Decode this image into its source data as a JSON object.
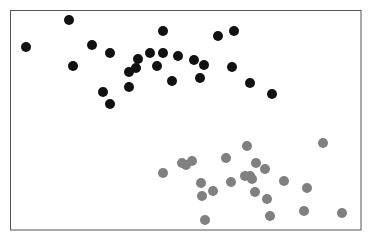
{
  "chart_data": {
    "type": "scatter",
    "title": "",
    "xlabel": "",
    "ylabel": "",
    "grid": false,
    "legend": null,
    "axes_ticks": false,
    "frame": {
      "left": 10,
      "top": 10,
      "right": 361,
      "bottom": 230
    },
    "series": [
      {
        "name": "cluster-black",
        "color": "#111111",
        "points": [
          [
            26,
            47
          ],
          [
            69,
            20
          ],
          [
            73,
            66
          ],
          [
            92,
            45
          ],
          [
            110,
            53
          ],
          [
            103,
            92
          ],
          [
            110,
            104
          ],
          [
            129,
            72
          ],
          [
            129,
            87
          ],
          [
            136,
            68
          ],
          [
            138,
            59
          ],
          [
            150,
            53
          ],
          [
            157,
            66
          ],
          [
            163,
            31
          ],
          [
            163,
            53
          ],
          [
            172,
            81
          ],
          [
            178,
            56
          ],
          [
            194,
            60
          ],
          [
            200,
            78
          ],
          [
            204,
            65
          ],
          [
            218,
            36
          ],
          [
            234,
            31
          ],
          [
            232,
            67
          ],
          [
            250,
            83
          ],
          [
            272,
            94
          ]
        ]
      },
      {
        "name": "cluster-gray",
        "color": "#808080",
        "points": [
          [
            163,
            173
          ],
          [
            182,
            163
          ],
          [
            186,
            165
          ],
          [
            192,
            161
          ],
          [
            201,
            183
          ],
          [
            202,
            196
          ],
          [
            213,
            191
          ],
          [
            226,
            158
          ],
          [
            231,
            182
          ],
          [
            247,
            146
          ],
          [
            245,
            176
          ],
          [
            250,
            176
          ],
          [
            252,
            179
          ],
          [
            256,
            163
          ],
          [
            255,
            192
          ],
          [
            265,
            169
          ],
          [
            267,
            199
          ],
          [
            270,
            216
          ],
          [
            284,
            181
          ],
          [
            307,
            188
          ],
          [
            304,
            211
          ],
          [
            323,
            143
          ],
          [
            342,
            213
          ],
          [
            205,
            220
          ]
        ]
      }
    ]
  }
}
